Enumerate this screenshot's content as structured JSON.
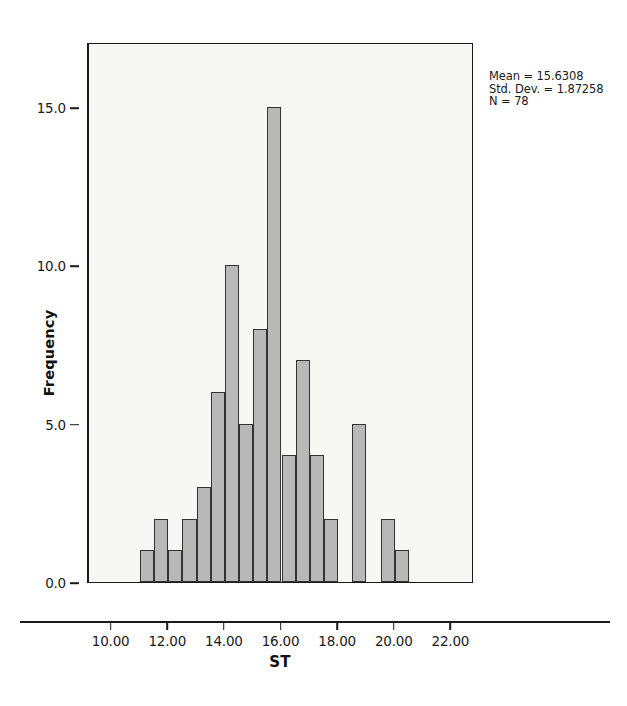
{
  "chart_data": {
    "type": "bar",
    "subtype": "histogram",
    "title": "",
    "xlabel": "ST",
    "ylabel": "Frequency",
    "xlim": [
      9.2,
      22.8
    ],
    "ylim": [
      0,
      17.05
    ],
    "bin_width": 0.5,
    "grid": false,
    "legend": null,
    "bar_color": "#b8b8b8",
    "bar_edge_color": "#333333",
    "plot_background": "#f7f7f5",
    "x_ticks": [
      10.0,
      12.0,
      14.0,
      16.0,
      18.0,
      20.0,
      22.0
    ],
    "x_tick_labels": [
      "10.00",
      "12.00",
      "14.00",
      "16.00",
      "18.00",
      "20.00",
      "22.00"
    ],
    "y_ticks": [
      0,
      5,
      10,
      15
    ],
    "y_tick_labels": [
      "0.0",
      "5.0",
      "10.0",
      "15.0"
    ],
    "bins": [
      {
        "x0": 11.0,
        "x1": 11.5,
        "value": 1
      },
      {
        "x0": 11.5,
        "x1": 12.0,
        "value": 2
      },
      {
        "x0": 12.0,
        "x1": 12.5,
        "value": 1
      },
      {
        "x0": 12.5,
        "x1": 13.0,
        "value": 2
      },
      {
        "x0": 13.0,
        "x1": 13.5,
        "value": 3
      },
      {
        "x0": 13.5,
        "x1": 14.0,
        "value": 6
      },
      {
        "x0": 14.0,
        "x1": 14.5,
        "value": 10
      },
      {
        "x0": 14.5,
        "x1": 15.0,
        "value": 5
      },
      {
        "x0": 15.0,
        "x1": 15.5,
        "value": 8
      },
      {
        "x0": 15.5,
        "x1": 16.0,
        "value": 15
      },
      {
        "x0": 16.0,
        "x1": 16.5,
        "value": 4
      },
      {
        "x0": 16.5,
        "x1": 17.0,
        "value": 7
      },
      {
        "x0": 17.0,
        "x1": 17.5,
        "value": 4
      },
      {
        "x0": 17.5,
        "x1": 18.0,
        "value": 2
      },
      {
        "x0": 18.0,
        "x1": 18.5,
        "value": 0
      },
      {
        "x0": 18.5,
        "x1": 19.0,
        "value": 5
      },
      {
        "x0": 19.0,
        "x1": 19.5,
        "value": 0
      },
      {
        "x0": 19.5,
        "x1": 20.0,
        "value": 2
      },
      {
        "x0": 20.0,
        "x1": 20.5,
        "value": 1
      }
    ]
  },
  "annotations": {
    "mean_label": "Mean = 15.6308",
    "std_dev_label": "Std. Dev. = 1.87258",
    "n_label": "N = 78"
  }
}
